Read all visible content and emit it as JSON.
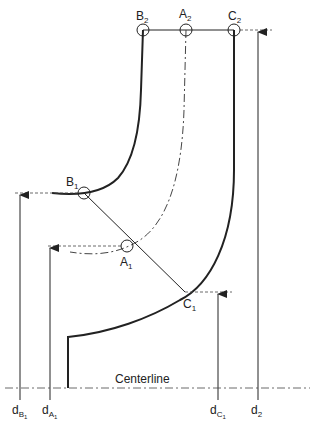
{
  "diagram": {
    "type": "impeller meridional cross-section",
    "points": {
      "B2": {
        "label": "B",
        "sub": "2"
      },
      "A2": {
        "label": "A",
        "sub": "2"
      },
      "C2": {
        "label": "C",
        "sub": "2"
      },
      "B1": {
        "label": "B",
        "sub": "1"
      },
      "A1": {
        "label": "A",
        "sub": "1"
      },
      "C1": {
        "label": "C",
        "sub": "1"
      }
    },
    "centerline_label": "Centerline",
    "dimensions": {
      "dB1": {
        "label": "d",
        "sub": "B",
        "subsub": "1"
      },
      "dA1": {
        "label": "d",
        "sub": "A",
        "subsub": "1"
      },
      "dC1": {
        "label": "d",
        "sub": "C",
        "subsub": "1"
      },
      "d2": {
        "label": "d",
        "sub": "2"
      }
    },
    "colors": {
      "line": "#222222",
      "background": "#ffffff"
    }
  }
}
